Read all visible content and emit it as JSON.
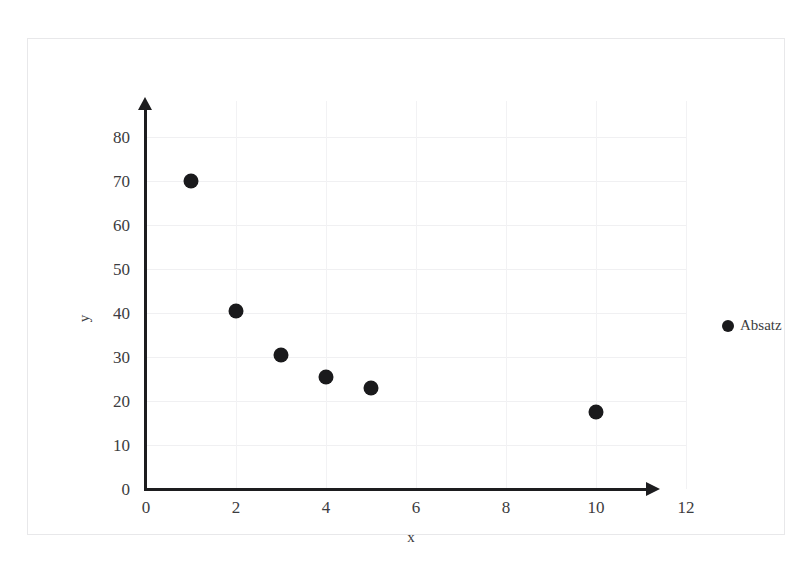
{
  "top_cut_text": "",
  "chart_data": {
    "type": "scatter",
    "title": "",
    "xlabel": "x",
    "ylabel": "y",
    "xlim": [
      0,
      12
    ],
    "ylim": [
      0,
      80
    ],
    "x_ticks": [
      "0",
      "2",
      "4",
      "6",
      "8",
      "10",
      "12"
    ],
    "y_ticks": [
      "0",
      "10",
      "20",
      "30",
      "40",
      "50",
      "60",
      "70",
      "80"
    ],
    "x_tick_values": [
      0,
      2,
      4,
      6,
      8,
      10,
      12
    ],
    "y_tick_values": [
      0,
      10,
      20,
      30,
      40,
      50,
      60,
      70,
      80
    ],
    "grid": true,
    "legend_position": "right",
    "marker_color": "#1a1a1c",
    "series": [
      {
        "name": "Absatz",
        "points": [
          {
            "x": 1,
            "y": 70
          },
          {
            "x": 2,
            "y": 40.5
          },
          {
            "x": 3,
            "y": 30.5
          },
          {
            "x": 4,
            "y": 25.5
          },
          {
            "x": 5,
            "y": 23
          },
          {
            "x": 10,
            "y": 17.5
          }
        ]
      }
    ]
  },
  "legend": {
    "entries": [
      {
        "label": "Absatz",
        "color": "#1a1a1c"
      }
    ]
  }
}
